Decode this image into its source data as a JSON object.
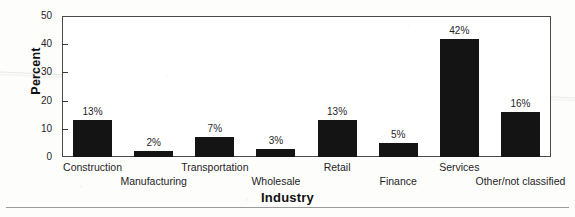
{
  "chart_data": {
    "type": "bar",
    "title": "",
    "xlabel": "Industry",
    "ylabel": "Percent",
    "categories": [
      "Construction",
      "Manufacturing",
      "Transportation",
      "Wholesale",
      "Retail",
      "Finance",
      "Services",
      "Other/not classified"
    ],
    "values": [
      13,
      2,
      7,
      3,
      13,
      5,
      42,
      16
    ],
    "data_labels": [
      "13%",
      "2%",
      "7%",
      "3%",
      "13%",
      "5%",
      "42%",
      "16%"
    ],
    "ylim": [
      0,
      50
    ],
    "yticks": [
      0,
      10,
      20,
      30,
      40,
      50
    ],
    "ytick_labels": [
      "0",
      "10",
      "20",
      "30",
      "40",
      "50"
    ],
    "grid": false,
    "legend": false,
    "bar_color": "#141414",
    "axis_color": "#4a4a4a"
  }
}
